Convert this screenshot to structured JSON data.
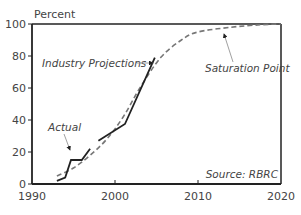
{
  "chart_data": {
    "type": "line",
    "title": "",
    "ylabel": "Percent",
    "xlabel": "",
    "xlim": [
      1990,
      2020
    ],
    "ylim": [
      0,
      100
    ],
    "x_ticks": [
      1990,
      2000,
      2010,
      2020
    ],
    "y_ticks": [
      0,
      20,
      40,
      60,
      80,
      100
    ],
    "grid": false,
    "legend": null,
    "series": [
      {
        "name": "Actual",
        "style": "solid",
        "color": "#222222",
        "x": [
          1993,
          1994,
          1994.7,
          1996,
          1997
        ],
        "y": [
          2,
          4,
          15,
          15,
          22
        ]
      },
      {
        "name": "Actual (continued)",
        "style": "solid",
        "color": "#222222",
        "x": [
          1998,
          2001.2,
          2004.8
        ],
        "y": [
          27,
          37.5,
          79
        ]
      },
      {
        "name": "Industry Projections / Saturation",
        "style": "dashed",
        "color": "#777777",
        "x": [
          1993,
          1995,
          1997,
          1999,
          2001,
          2003,
          2005.5,
          2008,
          2010,
          2014,
          2017.5,
          2020
        ],
        "y": [
          5,
          10,
          18,
          28,
          42,
          60,
          79,
          90,
          95,
          98,
          99.5,
          100
        ]
      }
    ],
    "annotations": [
      {
        "text": "Industry Projections",
        "x": 1991.2,
        "y": 76
      },
      {
        "text": "Saturation Point",
        "x": 2011.3,
        "y": 73
      },
      {
        "text": "Actual",
        "x": 1991.9,
        "y": 36
      },
      {
        "text": "Source: RBRC",
        "x": 2009.6,
        "y": 6
      }
    ]
  },
  "labels": {
    "y_axis_title": "Percent",
    "x_ticks": [
      "1990",
      "2000",
      "2010",
      "2020"
    ],
    "y_ticks": [
      "0",
      "20",
      "40",
      "60",
      "80",
      "100"
    ],
    "industry_projections": "Industry Projections",
    "saturation_point": "Saturation Point",
    "actual": "Actual",
    "source": "Source: RBRC"
  }
}
